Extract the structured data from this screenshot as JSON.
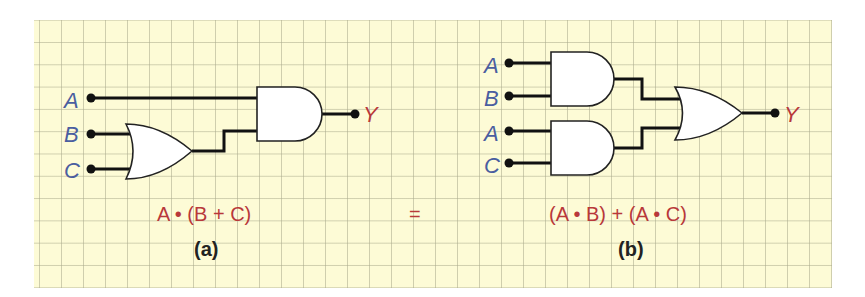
{
  "figure": {
    "background_color": "#fdfbd6",
    "wire_color": "#111111",
    "input_label_color": "#4a5ea0",
    "output_label_color": "#b8383a"
  },
  "circuit_a": {
    "inputs": [
      "A",
      "B",
      "C"
    ],
    "output": "Y",
    "gates": [
      {
        "type": "OR",
        "inputs": [
          "B",
          "C"
        ]
      },
      {
        "type": "AND",
        "inputs": [
          "A",
          "OR output"
        ]
      }
    ],
    "expression": "A • (B + C)",
    "caption": "(a)"
  },
  "equals_sign": "=",
  "circuit_b": {
    "inputs": [
      "A",
      "B",
      "A",
      "C"
    ],
    "output": "Y",
    "gates": [
      {
        "type": "AND",
        "inputs": [
          "A",
          "B"
        ]
      },
      {
        "type": "AND",
        "inputs": [
          "A",
          "C"
        ]
      },
      {
        "type": "OR",
        "inputs": [
          "AND1 output",
          "AND2 output"
        ]
      }
    ],
    "expression": "(A • B) + (A • C)",
    "caption": "(b)"
  }
}
